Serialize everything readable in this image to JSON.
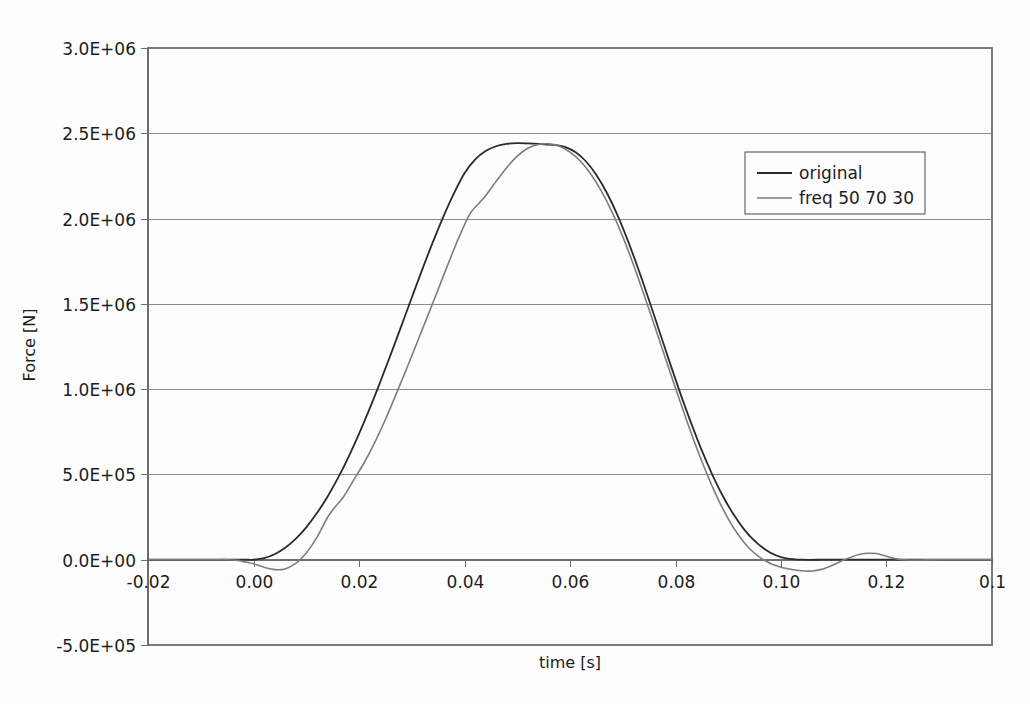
{
  "chart_data": {
    "type": "line",
    "title": "",
    "xlabel": "time [s]",
    "ylabel": "Force [N]",
    "xlim": [
      -0.02,
      0.14
    ],
    "ylim": [
      -500000,
      3000000
    ],
    "grid": true,
    "legend_position": "top-right",
    "x_ticks": [
      "-0.02",
      "0.00",
      "0.02",
      "0.04",
      "0.06",
      "0.08",
      "0.10",
      "0.12",
      "0.1"
    ],
    "x_tick_values": [
      -0.02,
      0.0,
      0.02,
      0.04,
      0.06,
      0.08,
      0.1,
      0.12,
      0.14
    ],
    "y_ticks": [
      "-5.0E+05",
      "0.0E+00",
      "5.0E+05",
      "1.0E+06",
      "1.5E+06",
      "2.0E+06",
      "2.5E+06",
      "3.0E+06"
    ],
    "y_tick_values": [
      -500000,
      0,
      500000,
      1000000,
      1500000,
      2000000,
      2500000,
      3000000
    ],
    "series": [
      {
        "name": "original",
        "color": "#2b2b2b",
        "width": 1.8,
        "x": [
          -0.02,
          -0.015,
          -0.01,
          -0.006,
          -0.003,
          -0.001,
          0.0,
          0.002,
          0.004,
          0.006,
          0.008,
          0.01,
          0.012,
          0.014,
          0.016,
          0.018,
          0.02,
          0.022,
          0.024,
          0.026,
          0.028,
          0.03,
          0.032,
          0.034,
          0.036,
          0.038,
          0.04,
          0.042,
          0.044,
          0.046,
          0.048,
          0.05,
          0.052,
          0.054,
          0.056,
          0.0575,
          0.059,
          0.061,
          0.063,
          0.065,
          0.067,
          0.069,
          0.071,
          0.073,
          0.075,
          0.077,
          0.079,
          0.081,
          0.083,
          0.085,
          0.087,
          0.089,
          0.091,
          0.093,
          0.095,
          0.097,
          0.099,
          0.101,
          0.104,
          0.108,
          0.112,
          0.118,
          0.125,
          0.132,
          0.14
        ],
        "y": [
          0,
          0,
          0,
          0,
          0,
          0,
          0,
          9000,
          32000,
          70000,
          122000,
          190000,
          272000,
          368000,
          478000,
          602000,
          738000,
          884000,
          1040000,
          1202000,
          1368000,
          1536000,
          1702000,
          1862000,
          2012000,
          2148000,
          2266000,
          2346000,
          2396000,
          2424000,
          2438000,
          2442000,
          2441000,
          2438000,
          2433000,
          2430000,
          2420000,
          2390000,
          2336000,
          2256000,
          2150000,
          2020000,
          1868000,
          1700000,
          1520000,
          1334000,
          1148000,
          968000,
          798000,
          640000,
          498000,
          372000,
          266000,
          178000,
          110000,
          60000,
          26000,
          8000,
          0,
          0,
          0,
          0,
          0,
          0,
          0
        ]
      },
      {
        "name": "freq 50 70 30",
        "color": "#7d7d7d",
        "width": 1.6,
        "x": [
          -0.02,
          -0.016,
          -0.012,
          -0.008,
          -0.005,
          -0.003,
          -0.001,
          0.0,
          0.002,
          0.004,
          0.006,
          0.008,
          0.01,
          0.012,
          0.014,
          0.0155,
          0.017,
          0.019,
          0.021,
          0.023,
          0.025,
          0.027,
          0.029,
          0.031,
          0.033,
          0.035,
          0.037,
          0.039,
          0.041,
          0.0425,
          0.044,
          0.046,
          0.048,
          0.05,
          0.052,
          0.054,
          0.056,
          0.058,
          0.06,
          0.062,
          0.064,
          0.066,
          0.068,
          0.07,
          0.072,
          0.074,
          0.076,
          0.078,
          0.08,
          0.082,
          0.084,
          0.086,
          0.088,
          0.09,
          0.092,
          0.094,
          0.096,
          0.098,
          0.1,
          0.1015,
          0.103,
          0.1045,
          0.106,
          0.1075,
          0.109,
          0.1105,
          0.112,
          0.1135,
          0.115,
          0.1165,
          0.118,
          0.12,
          0.122,
          0.125,
          0.13,
          0.135,
          0.14
        ],
        "y": [
          0,
          0,
          0,
          0,
          0,
          -4000,
          -16000,
          -24000,
          -44000,
          -58000,
          -54000,
          -22000,
          40000,
          130000,
          246000,
          310000,
          366000,
          468000,
          570000,
          688000,
          822000,
          968000,
          1118000,
          1272000,
          1428000,
          1584000,
          1742000,
          1894000,
          2026000,
          2082000,
          2134000,
          2218000,
          2298000,
          2366000,
          2412000,
          2434000,
          2438000,
          2424000,
          2390000,
          2336000,
          2258000,
          2158000,
          2036000,
          1894000,
          1732000,
          1556000,
          1374000,
          1190000,
          1006000,
          826000,
          656000,
          500000,
          360000,
          240000,
          142000,
          66000,
          14000,
          -22000,
          -44000,
          -54000,
          -62000,
          -66000,
          -66000,
          -58000,
          -42000,
          -22000,
          0,
          18000,
          32000,
          38000,
          36000,
          20000,
          4000,
          -2000,
          0,
          0,
          0
        ]
      }
    ]
  },
  "legend": {
    "items": [
      {
        "label": "original"
      },
      {
        "label": "freq 50 70 30"
      }
    ]
  },
  "colors": {
    "original": "#2b2b2b",
    "filtered": "#7d7d7d",
    "grid": "#8a8a8a",
    "frame": "#7a7a7a",
    "background": "#fdfdfd",
    "text": "#1c1c1c"
  }
}
